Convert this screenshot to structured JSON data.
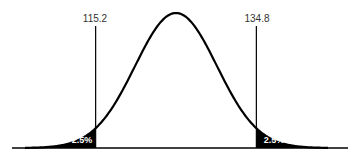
{
  "chart_data": {
    "type": "area",
    "title": "",
    "distribution": {
      "mean": 125,
      "sd": 5
    },
    "critical_values": [
      115.2,
      134.8
    ],
    "tails": [
      {
        "side": "left",
        "label": "2.5%",
        "bound": 115.2
      },
      {
        "side": "right",
        "label": "2.5%",
        "bound": 134.8
      }
    ],
    "xlabel": "",
    "ylabel": "",
    "grid": false,
    "legend": "none"
  },
  "labels": {
    "left_critical": "115.2",
    "right_critical": "134.8",
    "left_tail": "2.5%",
    "right_tail": "2.5%"
  }
}
